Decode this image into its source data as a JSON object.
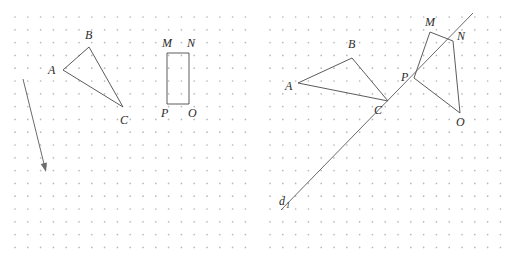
{
  "figure": {
    "background_color": "#ffffff",
    "grid_dot_color": "#b9b9bd",
    "stroke_color": "#4a4a4a",
    "label_color": "#2b2b2b",
    "width": 517,
    "height": 270
  },
  "panels": [
    {
      "id": "left",
      "name": "left-panel",
      "grid": {
        "x0": 15,
        "y0": 17,
        "spacing": 12.8,
        "cols": 19,
        "rows": 19
      },
      "shapes": {
        "triangle": {
          "name": "triangle-abc",
          "points": "63,70 89,47 123,107",
          "vertices": [
            {
              "label": "A",
              "x": 63,
              "y": 70,
              "lx": 48,
              "ly": 74
            },
            {
              "label": "B",
              "x": 89,
              "y": 47,
              "lx": 85,
              "ly": 39
            },
            {
              "label": "C",
              "x": 123,
              "y": 107,
              "lx": 120,
              "ly": 124
            }
          ]
        },
        "rectangle": {
          "name": "rectangle-mnop",
          "points": "167,53 189,53 189,104 167,104",
          "vertices": [
            {
              "label": "M",
              "x": 167,
              "y": 53,
              "lx": 162,
              "ly": 47
            },
            {
              "label": "N",
              "x": 189,
              "y": 53,
              "lx": 187,
              "ly": 47
            },
            {
              "label": "O",
              "x": 189,
              "y": 104,
              "lx": 188,
              "ly": 117
            },
            {
              "label": "P",
              "x": 167,
              "y": 104,
              "lx": 161,
              "ly": 117
            }
          ]
        },
        "vector": {
          "name": "translation-vector-arrow",
          "x1": 23,
          "y1": 79,
          "x2": 46,
          "y2": 172
        }
      }
    },
    {
      "id": "right",
      "name": "right-panel",
      "grid": {
        "x0": 12,
        "y0": 17,
        "spacing": 12.8,
        "cols": 19,
        "rows": 19
      },
      "shapes": {
        "triangle": {
          "name": "triangle-abc-image",
          "points": "40,83 94,58 130,101",
          "vertices": [
            {
              "label": "A",
              "x": 40,
              "y": 83,
              "lx": 27,
              "ly": 90
            },
            {
              "label": "B",
              "x": 94,
              "y": 58,
              "lx": 90,
              "ly": 48
            },
            {
              "label": "C",
              "x": 130,
              "y": 101,
              "lx": 116,
              "ly": 114
            }
          ]
        },
        "quad": {
          "name": "quadrilateral-mnop-image",
          "points": "172,32 195,41 202,113 156,78",
          "vertices": [
            {
              "label": "M",
              "x": 172,
              "y": 32,
              "lx": 167,
              "ly": 26
            },
            {
              "label": "N",
              "x": 195,
              "y": 41,
              "lx": 199,
              "ly": 40
            },
            {
              "label": "O",
              "x": 202,
              "y": 113,
              "lx": 198,
              "ly": 126
            },
            {
              "label": "P",
              "x": 156,
              "y": 78,
              "lx": 143,
              "ly": 81
            }
          ]
        },
        "line": {
          "name": "line-d",
          "x1": 23,
          "y1": 210,
          "x2": 215,
          "y2": 13,
          "label": "d",
          "label_subscript": "1",
          "lx": 21,
          "ly": 205
        }
      }
    }
  ]
}
